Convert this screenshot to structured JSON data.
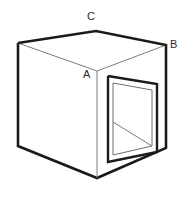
{
  "figure": {
    "background_color": "#ffffff",
    "line_color_outer": "#1b1b1b",
    "line_color_inner": "#7d7d7d",
    "labels": [
      {
        "id": "A",
        "text": "A",
        "x": 83,
        "y": 69,
        "anchor_vertex": "front-top",
        "note": "near top vertex where left face, right face and top face meet"
      },
      {
        "id": "B",
        "text": "B",
        "x": 170,
        "y": 39,
        "anchor_vertex": "right-top",
        "note": "top right vertex of cube"
      },
      {
        "id": "C",
        "text": "C",
        "x": 87,
        "y": 11,
        "anchor_vertex": "rear-top",
        "note": "far top vertex of cube"
      }
    ],
    "geometry": {
      "top_face": {
        "points": "18,43 96,31 166,45 97,71",
        "vertices": [
          {
            "name": "left-top",
            "x": 18,
            "y": 43
          },
          {
            "name": "rear-top",
            "x": 96,
            "y": 31
          },
          {
            "name": "right-top",
            "x": 166,
            "y": 45
          },
          {
            "name": "front-top",
            "x": 97,
            "y": 71
          }
        ]
      },
      "left_face": {
        "points": "18,43 97,71 97,178 18,146"
      },
      "right_face": {
        "points": "97,71 166,45 166,148 97,178"
      },
      "outer_silhouette": "18,43 96,31 166,45 166,148 97,178 18,146",
      "left_vertical_edge": "18,43 18,146",
      "front_vertical_edge": "97,71 97,178",
      "right_vertical_edge": "166,45 166,148",
      "top_left_edge": "18,43 96,31",
      "top_right_edge": "96,31 166,45",
      "top_inner_left_edge": "18,43 97,71",
      "top_inner_right_edge": "97,71 166,45",
      "bottom_left_edge": "18,146 97,178",
      "bottom_right_edge": "97,178 166,148",
      "hole_outer": "108,76 157,84 157,152 108,162",
      "hole_inner": "113,83 152,90 152,146 113,155",
      "hole_floor_line": "113,122 152,146",
      "hole_floor_polygon": "113,122 152,146 152,146 113,155"
    }
  }
}
